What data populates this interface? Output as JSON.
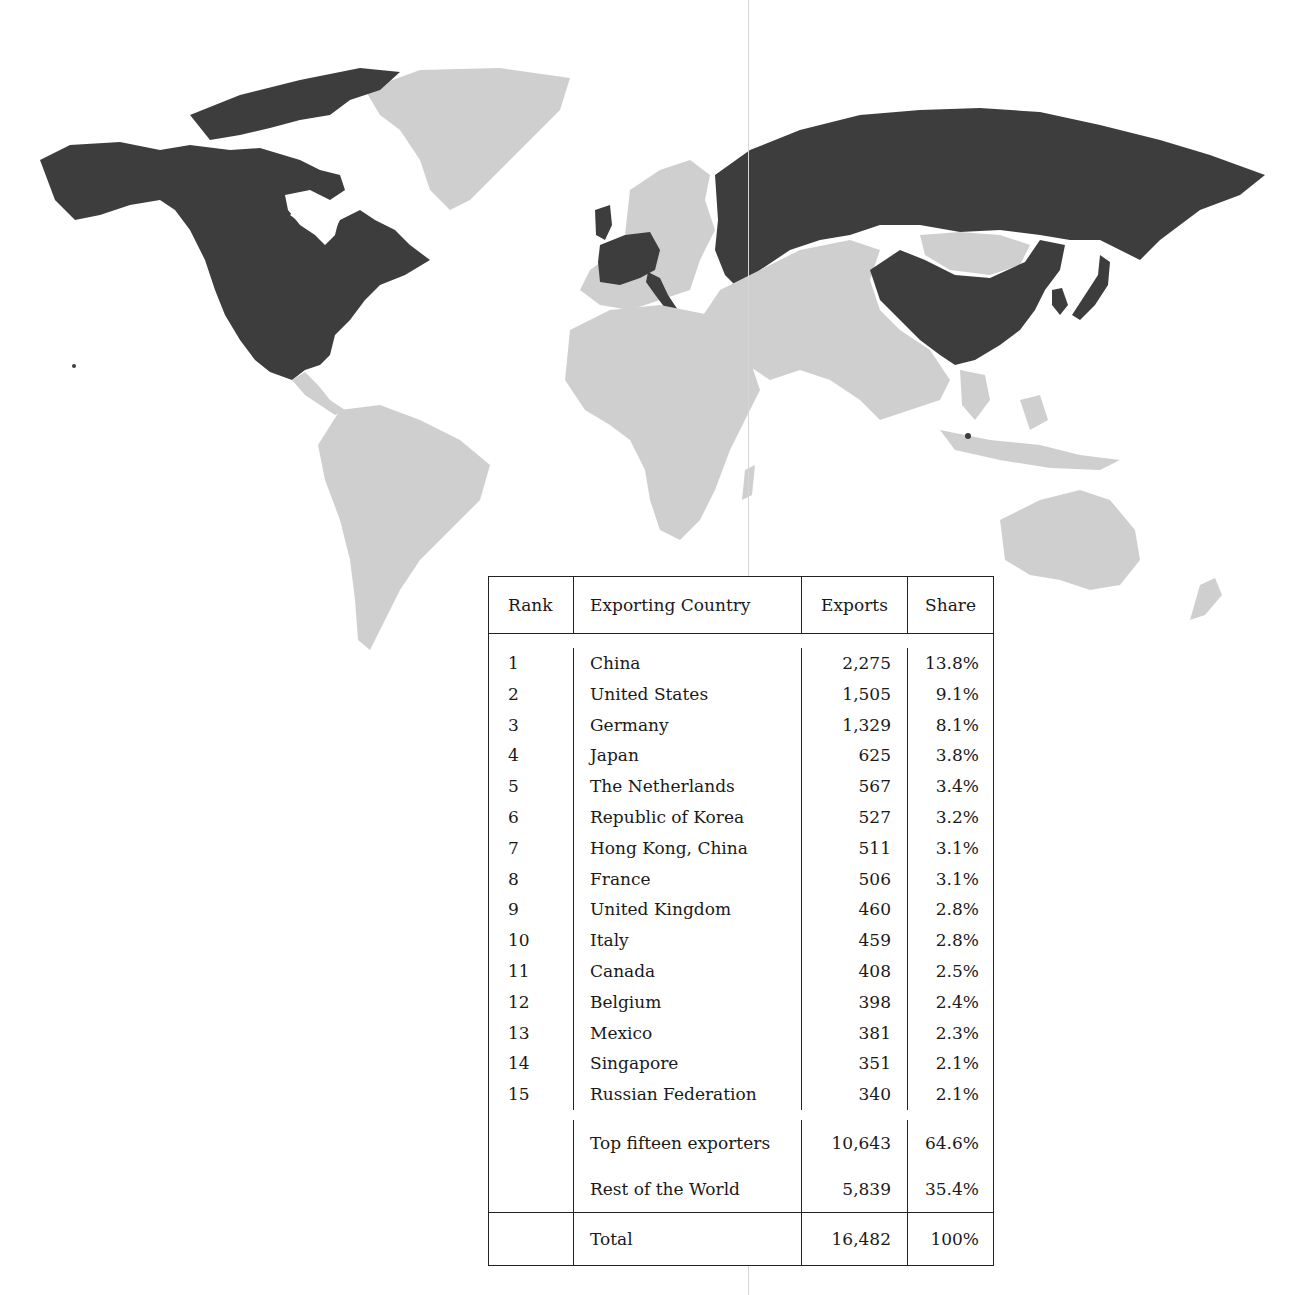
{
  "map": {
    "highlight_color": "#3d3d3d",
    "other_color": "#cfcfcf",
    "background_color": "#ffffff",
    "highlighted_regions": [
      "Canada",
      "United States",
      "Mexico",
      "United Kingdom",
      "France",
      "Belgium",
      "The Netherlands",
      "Germany",
      "Italy",
      "Russian Federation",
      "China",
      "Republic of Korea",
      "Japan",
      "Hong Kong, China",
      "Singapore"
    ]
  },
  "table": {
    "headers": {
      "rank": "Rank",
      "country": "Exporting Country",
      "exports": "Exports",
      "share": "Share"
    },
    "rows": [
      {
        "rank": "1",
        "country": "China",
        "exports": "2,275",
        "share": "13.8%"
      },
      {
        "rank": "2",
        "country": "United States",
        "exports": "1,505",
        "share": "9.1%"
      },
      {
        "rank": "3",
        "country": "Germany",
        "exports": "1,329",
        "share": "8.1%"
      },
      {
        "rank": "4",
        "country": "Japan",
        "exports": "625",
        "share": "3.8%"
      },
      {
        "rank": "5",
        "country": "The Netherlands",
        "exports": "567",
        "share": "3.4%"
      },
      {
        "rank": "6",
        "country": "Republic of Korea",
        "exports": "527",
        "share": "3.2%"
      },
      {
        "rank": "7",
        "country": "Hong Kong, China",
        "exports": "511",
        "share": "3.1%"
      },
      {
        "rank": "8",
        "country": "France",
        "exports": "506",
        "share": "3.1%"
      },
      {
        "rank": "9",
        "country": "United Kingdom",
        "exports": "460",
        "share": "2.8%"
      },
      {
        "rank": "10",
        "country": "Italy",
        "exports": "459",
        "share": "2.8%"
      },
      {
        "rank": "11",
        "country": "Canada",
        "exports": "408",
        "share": "2.5%"
      },
      {
        "rank": "12",
        "country": "Belgium",
        "exports": "398",
        "share": "2.4%"
      },
      {
        "rank": "13",
        "country": "Mexico",
        "exports": "381",
        "share": "2.3%"
      },
      {
        "rank": "14",
        "country": "Singapore",
        "exports": "351",
        "share": "2.1%"
      },
      {
        "rank": "15",
        "country": "Russian Federation",
        "exports": "340",
        "share": "2.1%"
      }
    ],
    "summary": [
      {
        "label": "Top fifteen exporters",
        "exports": "10,643",
        "share": "64.6%"
      },
      {
        "label": "Rest of the World",
        "exports": "5,839",
        "share": "35.4%"
      }
    ],
    "total": {
      "label": "Total",
      "exports": "16,482",
      "share": "100%"
    }
  }
}
